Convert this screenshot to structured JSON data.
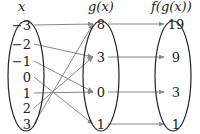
{
  "headers": {
    "x": "x",
    "g": "g(x)",
    "f": "f(g(x))"
  },
  "x_values": [
    "−3",
    "−2",
    "−1",
    "0",
    "1",
    "2",
    "3"
  ],
  "g_values": [
    "8",
    "3",
    "0",
    "1"
  ],
  "f_values": [
    "19",
    "9",
    "3",
    "1"
  ],
  "mapping_x_to_g": [
    0,
    1,
    2,
    3,
    2,
    1,
    0
  ],
  "mapping_g_to_f": [
    0,
    1,
    2,
    3
  ],
  "colors": {
    "arrow": "#888888",
    "ellipse": "#222222",
    "text": "#222222"
  }
}
